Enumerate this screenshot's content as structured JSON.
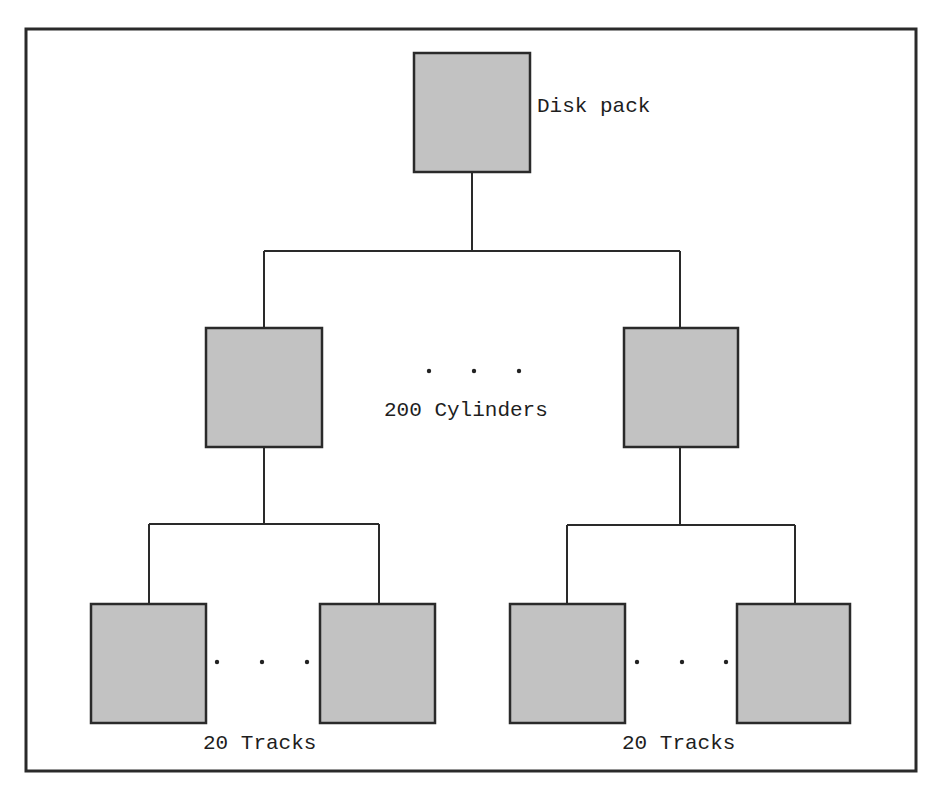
{
  "diagram": {
    "type": "hierarchy-tree",
    "colors": {
      "node_fill": "#c2c2c2",
      "stroke": "#2a2a2a",
      "text": "#1e1e1e",
      "background": "#ffffff"
    },
    "root": {
      "id": "disk-pack",
      "label": "Disk pack"
    },
    "levels": [
      {
        "id": "cylinders",
        "label": "200 Cylinders",
        "count": 200,
        "ellipsis": "· · ·",
        "visible_nodes": [
          "cylinder-first",
          "cylinder-last"
        ]
      },
      {
        "id": "tracks",
        "groups": [
          {
            "parent": "cylinder-first",
            "label": "20 Tracks",
            "count": 20,
            "ellipsis": "· · ·",
            "visible_nodes": [
              "track-first",
              "track-last"
            ]
          },
          {
            "parent": "cylinder-last",
            "label": "20 Tracks",
            "count": 20,
            "ellipsis": "· · ·",
            "visible_nodes": [
              "track-first",
              "track-last"
            ]
          }
        ]
      }
    ],
    "edges": [
      [
        "disk-pack",
        "cylinder-first"
      ],
      [
        "disk-pack",
        "cylinder-last"
      ],
      [
        "cylinder-first",
        "track-first"
      ],
      [
        "cylinder-first",
        "track-last"
      ],
      [
        "cylinder-last",
        "track-first"
      ],
      [
        "cylinder-last",
        "track-last"
      ]
    ]
  }
}
